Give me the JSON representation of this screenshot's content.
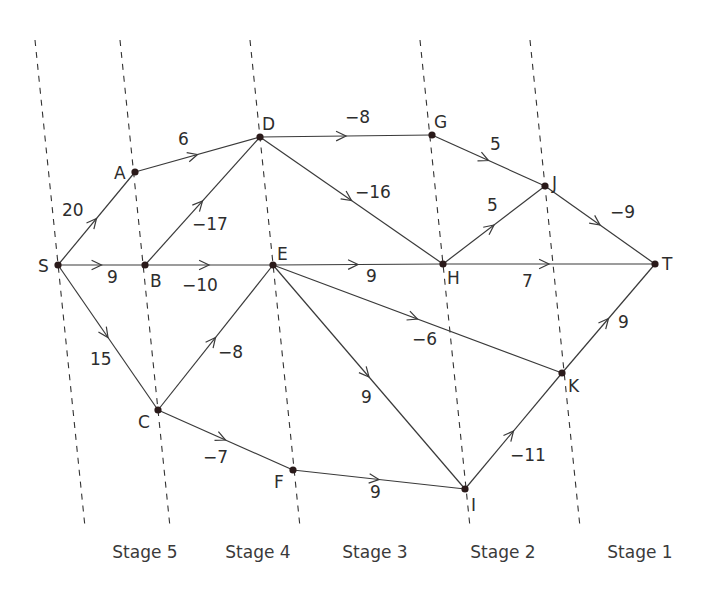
{
  "stages": [
    {
      "label": "Stage 5",
      "x": 145,
      "y": 558
    },
    {
      "label": "Stage 4",
      "x": 258,
      "y": 558
    },
    {
      "label": "Stage 3",
      "x": 375,
      "y": 558
    },
    {
      "label": "Stage 2",
      "x": 503,
      "y": 558
    },
    {
      "label": "Stage 1",
      "x": 640,
      "y": 558
    }
  ],
  "stage_lines": [
    {
      "x1": 35,
      "y1": 40,
      "x2": 85,
      "y2": 527
    },
    {
      "x1": 120,
      "y1": 40,
      "x2": 170,
      "y2": 527
    },
    {
      "x1": 250,
      "y1": 40,
      "x2": 300,
      "y2": 527
    },
    {
      "x1": 420,
      "y1": 40,
      "x2": 470,
      "y2": 527
    },
    {
      "x1": 530,
      "y1": 40,
      "x2": 580,
      "y2": 527
    }
  ],
  "nodes": [
    {
      "id": "S",
      "x": 58,
      "y": 265,
      "lx": 38,
      "ly": 272
    },
    {
      "id": "A",
      "x": 135,
      "y": 172,
      "lx": 114,
      "ly": 179
    },
    {
      "id": "B",
      "x": 145,
      "y": 265,
      "lx": 150,
      "ly": 287
    },
    {
      "id": "C",
      "x": 158,
      "y": 410,
      "lx": 138,
      "ly": 428
    },
    {
      "id": "D",
      "x": 260,
      "y": 137,
      "lx": 262,
      "ly": 130
    },
    {
      "id": "E",
      "x": 273,
      "y": 265,
      "lx": 277,
      "ly": 260
    },
    {
      "id": "F",
      "x": 293,
      "y": 470,
      "lx": 274,
      "ly": 488
    },
    {
      "id": "G",
      "x": 432,
      "y": 135,
      "lx": 434,
      "ly": 128
    },
    {
      "id": "H",
      "x": 443,
      "y": 264,
      "lx": 447,
      "ly": 284
    },
    {
      "id": "I",
      "x": 465,
      "y": 489,
      "lx": 471,
      "ly": 511
    },
    {
      "id": "J",
      "x": 545,
      "y": 186,
      "lx": 552,
      "ly": 189
    },
    {
      "id": "K",
      "x": 562,
      "y": 373,
      "lx": 568,
      "ly": 392
    },
    {
      "id": "T",
      "x": 655,
      "y": 264,
      "lx": 662,
      "ly": 270
    }
  ],
  "edges": [
    {
      "from": "S",
      "to": "A",
      "weight": "20",
      "lx": 62,
      "ly": 216
    },
    {
      "from": "S",
      "to": "B",
      "weight": "9",
      "lx": 107,
      "ly": 283
    },
    {
      "from": "S",
      "to": "C",
      "weight": "15",
      "lx": 90,
      "ly": 365
    },
    {
      "from": "A",
      "to": "D",
      "weight": "6",
      "lx": 178,
      "ly": 145
    },
    {
      "from": "B",
      "to": "D",
      "weight": "−17",
      "lx": 192,
      "ly": 230
    },
    {
      "from": "B",
      "to": "E",
      "weight": "−10",
      "lx": 182,
      "ly": 291
    },
    {
      "from": "C",
      "to": "E",
      "weight": "−8",
      "lx": 218,
      "ly": 358
    },
    {
      "from": "C",
      "to": "F",
      "weight": "−7",
      "lx": 203,
      "ly": 463
    },
    {
      "from": "D",
      "to": "G",
      "weight": "−8",
      "lx": 345,
      "ly": 123
    },
    {
      "from": "D",
      "to": "H",
      "weight": "−16",
      "lx": 355,
      "ly": 198
    },
    {
      "from": "E",
      "to": "H",
      "weight": "9",
      "lx": 366,
      "ly": 282
    },
    {
      "from": "E",
      "to": "K",
      "weight": "−6",
      "lx": 412,
      "ly": 345
    },
    {
      "from": "E",
      "to": "I",
      "weight": "9",
      "lx": 361,
      "ly": 403
    },
    {
      "from": "F",
      "to": "I",
      "weight": "9",
      "lx": 370,
      "ly": 498
    },
    {
      "from": "G",
      "to": "J",
      "weight": "5",
      "lx": 490,
      "ly": 150
    },
    {
      "from": "H",
      "to": "J",
      "weight": "5",
      "lx": 487,
      "ly": 211
    },
    {
      "from": "H",
      "to": "T",
      "weight": "7",
      "lx": 522,
      "ly": 287
    },
    {
      "from": "I",
      "to": "K",
      "weight": "−11",
      "lx": 510,
      "ly": 461
    },
    {
      "from": "J",
      "to": "T",
      "weight": "−9",
      "lx": 610,
      "ly": 218
    },
    {
      "from": "K",
      "to": "T",
      "weight": "9",
      "lx": 618,
      "ly": 328
    }
  ]
}
